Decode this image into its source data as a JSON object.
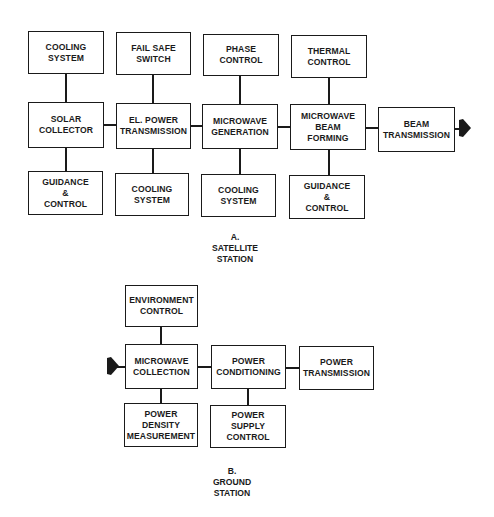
{
  "diagram": {
    "satellite_station": {
      "caption": "A.\nSATELLITE\nSTATION",
      "top_row": [
        {
          "id": "cooling-system-1",
          "label": "COOLING\nSYSTEM"
        },
        {
          "id": "fail-safe-switch",
          "label": "FAIL SAFE\nSWITCH"
        },
        {
          "id": "phase-control",
          "label": "PHASE\nCONTROL"
        },
        {
          "id": "thermal-control",
          "label": "THERMAL\nCONTROL"
        }
      ],
      "main_row": [
        {
          "id": "solar-collector",
          "label": "SOLAR\nCOLLECTOR"
        },
        {
          "id": "el-power-transmission",
          "label": "EL. POWER\nTRANSMISSION"
        },
        {
          "id": "microwave-generation",
          "label": "MICROWAVE\nGENERATION"
        },
        {
          "id": "microwave-beam-forming",
          "label": "MICROWAVE\nBEAM\nFORMING"
        },
        {
          "id": "beam-transmission",
          "label": "BEAM\nTRANSMISSION"
        }
      ],
      "bottom_row": [
        {
          "id": "guidance-control-1",
          "label": "GUIDANCE\n&\nCONTROL"
        },
        {
          "id": "cooling-system-2",
          "label": "COOLING\nSYSTEM"
        },
        {
          "id": "cooling-system-3",
          "label": "COOLING\nSYSTEM"
        },
        {
          "id": "guidance-control-2",
          "label": "GUIDANCE\n&\nCONTROL"
        }
      ],
      "output_arrow": "right"
    },
    "ground_station": {
      "caption": "B.\nGROUND\nSTATION",
      "top_row": [
        {
          "id": "environment-control",
          "label": "ENVIRONMENT\nCONTROL"
        }
      ],
      "main_row": [
        {
          "id": "microwave-collection",
          "label": "MICROWAVE\nCOLLECTION"
        },
        {
          "id": "power-conditioning",
          "label": "POWER\nCONDITIONING"
        },
        {
          "id": "power-transmission",
          "label": "POWER\nTRANSMISSION"
        }
      ],
      "bottom_row": [
        {
          "id": "power-density-measurement",
          "label": "POWER\nDENSITY\nMEASUREMENT"
        },
        {
          "id": "power-supply-control",
          "label": "POWER\nSUPPLY\nCONTROL"
        }
      ],
      "input_arrow": "right"
    },
    "colors": {
      "ink": "#1a1a1a",
      "background": "#ffffff"
    }
  }
}
